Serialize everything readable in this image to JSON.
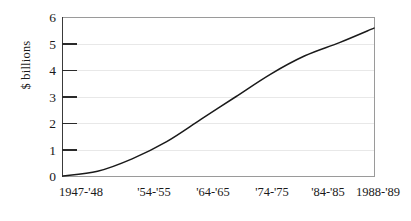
{
  "chart_data": {
    "type": "line",
    "title": "",
    "subtitle": "",
    "xlabel": "",
    "ylabel": "$ billions",
    "ylim": [
      0,
      6
    ],
    "yticks": [
      0,
      1,
      2,
      3,
      4,
      5,
      6
    ],
    "ytick_labels": [
      "0",
      "1",
      "2",
      "3",
      "4",
      "5",
      "6"
    ],
    "xtick_labels": [
      "1947-'48",
      "'54-'55",
      "'64-'65",
      "'74-'75",
      "'84-'85",
      "1988-'89"
    ],
    "x": [
      "1947-'48",
      "'54-'55",
      "'64-'65",
      "'74-'75",
      "'84-'85",
      "1988-'89"
    ],
    "grid": "horizontal",
    "legend": "none",
    "series": [
      {
        "name": "",
        "color": "#1a1a1a",
        "values": [
          0.0,
          0.65,
          2.15,
          3.85,
          5.05,
          5.6
        ],
        "points": [
          {
            "x": "1947-'48",
            "y": 0.0
          },
          {
            "x": "'50-'51",
            "y": 0.18
          },
          {
            "x": "'54-'55",
            "y": 0.65
          },
          {
            "x": "'59-'60",
            "y": 1.3
          },
          {
            "x": "'64-'65",
            "y": 2.15
          },
          {
            "x": "'69-'70",
            "y": 3.0
          },
          {
            "x": "'74-'75",
            "y": 3.85
          },
          {
            "x": "'79-'80",
            "y": 4.55
          },
          {
            "x": "'84-'85",
            "y": 5.05
          },
          {
            "x": "1988-'89",
            "y": 5.6
          }
        ]
      }
    ],
    "annotations": []
  },
  "axes": {
    "y_title": "$ billions",
    "y_labels": [
      "6",
      "5",
      "4",
      "3",
      "2",
      "1",
      "0"
    ],
    "x_labels": [
      "1947-'48",
      "'54-'55",
      "'64-'65",
      "'74-'75",
      "'84-'85",
      "1988-'89"
    ]
  },
  "style": {
    "line_color": "#1a1a1a",
    "axis_color": "#3a3a3a",
    "frame_color": "#9a9a9a",
    "grid_color": "#e8e8e8",
    "background": "#ffffff"
  }
}
